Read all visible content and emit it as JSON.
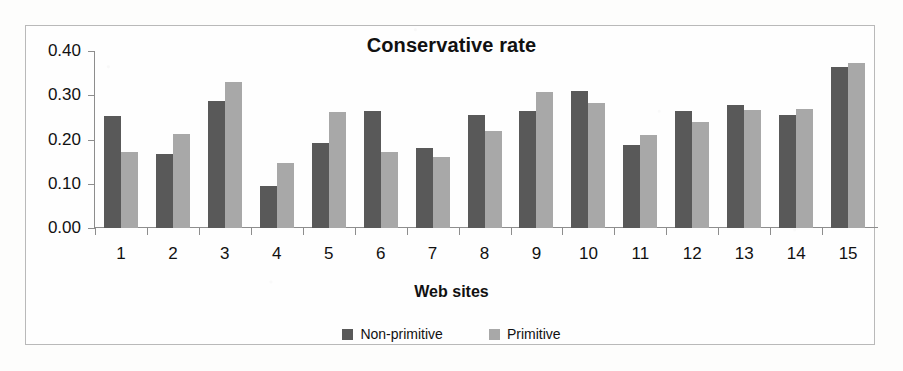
{
  "chart_data": {
    "type": "bar",
    "title": "Conservative rate",
    "xlabel": "Web sites",
    "ylabel": "",
    "ylim": [
      0.0,
      0.4
    ],
    "ytick_labels": [
      "0.40",
      "0.30",
      "0.20",
      "0.10",
      "0.00"
    ],
    "ytick_values": [
      0.4,
      0.3,
      0.2,
      0.1,
      0.0
    ],
    "grid": false,
    "legend_position": "bottom-center",
    "categories": [
      "1",
      "2",
      "3",
      "4",
      "5",
      "6",
      "7",
      "8",
      "9",
      "10",
      "11",
      "12",
      "13",
      "14",
      "15"
    ],
    "series": [
      {
        "name": "Non-primitive",
        "color": "#595959",
        "values": [
          0.253,
          0.168,
          0.288,
          0.095,
          0.193,
          0.264,
          0.18,
          0.255,
          0.264,
          0.31,
          0.187,
          0.265,
          0.277,
          0.255,
          0.363
        ]
      },
      {
        "name": "Primitive",
        "color": "#a8a8a8",
        "values": [
          0.172,
          0.212,
          0.33,
          0.148,
          0.262,
          0.172,
          0.16,
          0.22,
          0.308,
          0.283,
          0.21,
          0.24,
          0.267,
          0.27,
          0.373
        ]
      }
    ]
  }
}
